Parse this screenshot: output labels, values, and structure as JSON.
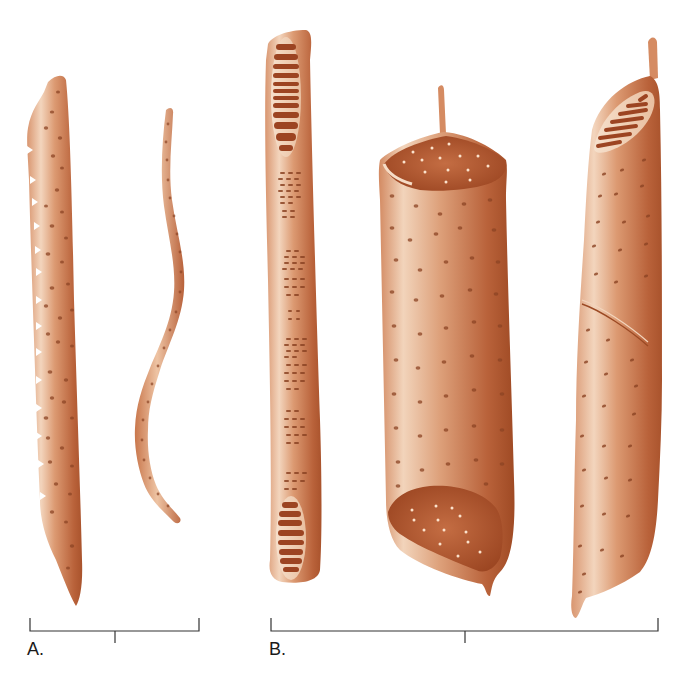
{
  "figure": {
    "background": "#ffffff",
    "cell_colors": {
      "light": "#f2d2b8",
      "mid": "#d9936a",
      "dark": "#a8512a",
      "shadow": "#8a3a1a",
      "pit": "#8c4424",
      "pit_highlight": "#fbe6d4"
    },
    "groups": [
      {
        "id": "A",
        "label": "A.",
        "description": "Tracheids",
        "cells": [
          {
            "name": "tracheid-wide",
            "pit_type": "bordered pits"
          },
          {
            "name": "tracheid-narrow",
            "pit_type": "bordered pits"
          }
        ],
        "scale_bar": {
          "x_start": 30,
          "x_end": 199,
          "center_tick_x": 115,
          "y": 631
        }
      },
      {
        "id": "B",
        "label": "B.",
        "description": "Vessel elements",
        "cells": [
          {
            "name": "vessel-element-scalariform",
            "perforation_plate": "scalariform"
          },
          {
            "name": "vessel-element-simple",
            "perforation_plate": "simple"
          },
          {
            "name": "vessel-element-oblique-scalariform",
            "perforation_plate": "scalariform"
          }
        ],
        "scale_bar": {
          "x_start": 271,
          "x_end": 658,
          "center_tick_x": 465,
          "y": 631
        }
      }
    ]
  }
}
